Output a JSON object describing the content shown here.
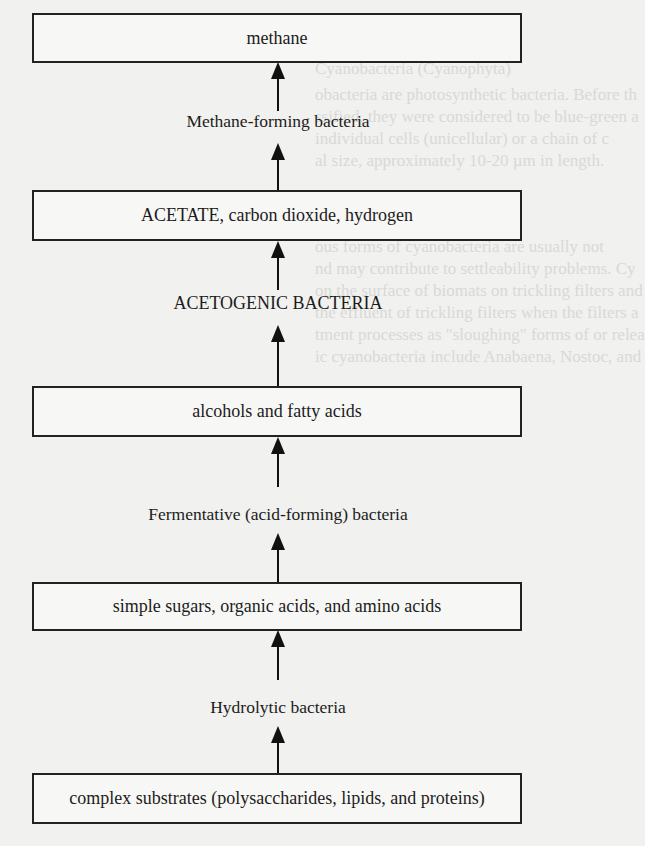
{
  "diagram": {
    "type": "flow",
    "direction": "bottom-to-top",
    "boxes": [
      {
        "id": "methane",
        "label": "methane"
      },
      {
        "id": "acetate",
        "label": "ACETATE, carbon dioxide, hydrogen"
      },
      {
        "id": "alcohols",
        "label": "alcohols and fatty acids"
      },
      {
        "id": "simple-sugars",
        "label": "simple sugars, organic acids, and amino acids"
      },
      {
        "id": "complex-substrates",
        "label": "complex substrates (polysaccharides, lipids, and proteins)"
      }
    ],
    "agents": [
      {
        "id": "methane-forming",
        "label": "Methane-forming bacteria"
      },
      {
        "id": "acetogenic",
        "label": "ACETOGENIC BACTERIA"
      },
      {
        "id": "fermentative",
        "label": "Fermentative (acid-forming) bacteria"
      },
      {
        "id": "hydrolytic",
        "label": "Hydrolytic bacteria"
      }
    ],
    "edges": [
      {
        "from": "complex-substrates",
        "via": "hydrolytic",
        "to": "simple-sugars"
      },
      {
        "from": "simple-sugars",
        "via": "fermentative",
        "to": "alcohols"
      },
      {
        "from": "alcohols",
        "via": "acetogenic",
        "to": "acetate"
      },
      {
        "from": "acetate",
        "via": "methane-forming",
        "to": "methane"
      }
    ]
  },
  "bleed_through_text": {
    "lines": [
      "Cyanobacteria (Cyanophyta)",
      "obacteria are photosynthetic bacteria. Before th",
      "ssified, they were considered to be blue-green a",
      "individual cells (unicellular) or a chain of c",
      "al size, approximately 10-20 µm in length.",
      "ous forms of cyanobacteria are usually not",
      "nd may contribute to settleability problems. Cy",
      "on the surface of biomats on trickling filters and",
      "the effluent of trickling filters when the filters a",
      "tment processes as \"sloughing\" forms of or relea",
      "ic cyanobacteria include Anabaena, Nostoc, and"
    ]
  },
  "colors": {
    "background": "#f1f1ef",
    "line": "#222222",
    "text": "#1c1c1c"
  }
}
